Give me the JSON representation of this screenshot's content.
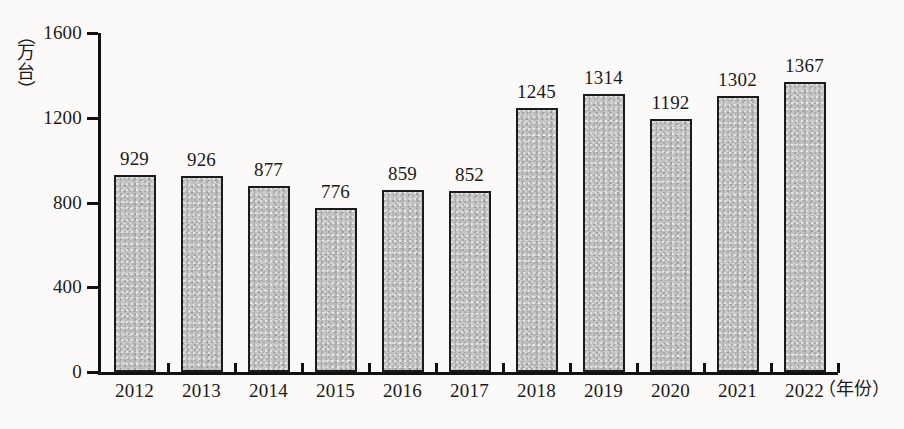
{
  "chart_data": {
    "type": "bar",
    "title": "",
    "xlabel": "（年份）",
    "ylabel": "（万台）",
    "categories": [
      "2012",
      "2013",
      "2014",
      "2015",
      "2016",
      "2017",
      "2018",
      "2019",
      "2020",
      "2021",
      "2022"
    ],
    "values": [
      929,
      926,
      877,
      776,
      859,
      852,
      1245,
      1314,
      1192,
      1302,
      1367
    ],
    "ylim": [
      0,
      1600
    ],
    "yticks": [
      "0",
      "400",
      "800",
      "1200",
      "1600"
    ],
    "ytick_values": [
      0,
      400,
      800,
      1200,
      1600
    ],
    "grid": false,
    "legend": null,
    "bar_color": "#c3c3c3",
    "bar_border_color": "#1b1b1b",
    "background_color": "#fbfaf8"
  },
  "axis": {
    "y_unit_chars": [
      "万",
      "台"
    ],
    "y_unit_open_paren": "（",
    "y_unit_close_paren": "）",
    "x_unit_label": "（年份）"
  }
}
